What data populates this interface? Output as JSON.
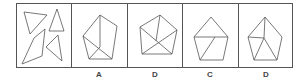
{
  "puzzle": {
    "question_panel": {
      "description": "four pieces: three triangles and one quadrilateral"
    },
    "options": [
      {
        "label": "A"
      },
      {
        "label": "D"
      },
      {
        "label": "C"
      },
      {
        "label": "D"
      }
    ]
  },
  "colors": {
    "line": "#555555",
    "background": "#ffffff"
  }
}
